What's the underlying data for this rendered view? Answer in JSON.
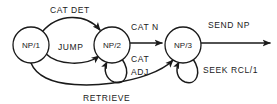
{
  "diagram": {
    "stroke_color": "#1a1a1a",
    "background_color": "#ffffff",
    "nodes": [
      {
        "id": "np1",
        "label": "NP/1",
        "cx": 31,
        "cy": 45,
        "r": 18
      },
      {
        "id": "np2",
        "label": "NP/2",
        "cx": 112,
        "cy": 45,
        "r": 18
      },
      {
        "id": "np3",
        "label": "NP/3",
        "cx": 183,
        "cy": 45,
        "r": 18
      }
    ],
    "edges": [
      {
        "id": "e1",
        "from": "np1",
        "to": "np2",
        "label": "CAT DET",
        "kind": "arc-over"
      },
      {
        "id": "e2",
        "from": "np1",
        "to": "np2",
        "label": "JUMP",
        "kind": "arc-under"
      },
      {
        "id": "e3",
        "from": "np2",
        "to": "np3",
        "label": "CAT N",
        "kind": "straight"
      },
      {
        "id": "e4",
        "from": "np2",
        "to": "np2",
        "label": "CAT ADJ",
        "kind": "self-loop"
      },
      {
        "id": "e5",
        "from": "np3",
        "to": "np3",
        "label": "SEEK RCL/1",
        "kind": "self-loop"
      },
      {
        "id": "e6",
        "from": "np3",
        "to": "np1",
        "label": "RETRIEVE",
        "kind": "arc-return"
      },
      {
        "id": "e7",
        "from": "np3",
        "to": "",
        "label": "SEND NP",
        "kind": "exit"
      }
    ],
    "labels": {
      "cat_det": "CAT DET",
      "jump": "JUMP",
      "cat_n": "CAT N",
      "cat_adj_1": "CAT",
      "cat_adj_2": "ADJ",
      "send_np": "SEND NP",
      "seek_rcl": "SEEK RCL/1",
      "retrieve": "RETRIEVE"
    },
    "node_labels": {
      "np1": "NP/1",
      "np2": "NP/2",
      "np3": "NP/3"
    }
  }
}
